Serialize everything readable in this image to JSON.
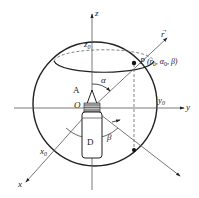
{
  "diagram": {
    "type": "spherical coordinate system diagram",
    "axes": {
      "z": "z",
      "z0": "z",
      "z0_sub": "0",
      "y": "y",
      "y0": "y",
      "y0_sub": "0",
      "x": "x",
      "x0": "x",
      "x0_sub": "0"
    },
    "origin": "O",
    "vector_r": "r",
    "point_p": {
      "label": "P",
      "coords": "(r",
      "r_sub": "0",
      "alpha": ", α",
      "alpha_sub": "0",
      "beta": ", β)"
    },
    "angles": {
      "alpha": "α",
      "beta": "β"
    },
    "labels": {
      "A": "A",
      "D": "D"
    },
    "colors": {
      "line": "#222222",
      "axis": "#555555",
      "background": "#ffffff"
    }
  }
}
